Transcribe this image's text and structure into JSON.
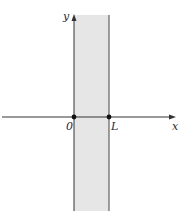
{
  "diagram": {
    "colors": {
      "strip_fill": "#e6e6e6",
      "axis": "#333333",
      "boundary": "#444444",
      "point": "#111111"
    },
    "axes": {
      "x_label": "x",
      "y_label": "y"
    },
    "points": [
      {
        "label": "0",
        "x": 0
      },
      {
        "label": "L",
        "x": "L"
      }
    ]
  }
}
